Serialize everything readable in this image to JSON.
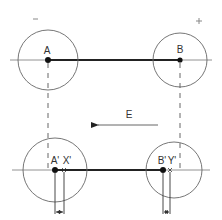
{
  "diagram": {
    "colors": {
      "stroke": "#555555",
      "thick": "#222222",
      "text": "#333333",
      "background": "#ffffff"
    },
    "polarity": {
      "negative": "−",
      "positive": "+"
    },
    "top": {
      "point_a": {
        "label": "A",
        "cx": 48,
        "cy": 60,
        "r": 30
      },
      "point_b": {
        "label": "B",
        "cx": 180,
        "cy": 60,
        "r": 27
      }
    },
    "field": {
      "label": "E",
      "direction": "left"
    },
    "bottom": {
      "point_a_prime": {
        "label": "A'",
        "cx": 55,
        "cy": 170,
        "r": 32
      },
      "point_x_prime": {
        "label": "X'",
        "x": 64
      },
      "point_b_prime": {
        "label": "B'",
        "x": 163
      },
      "point_y_prime": {
        "label": "Y'",
        "x": 170
      },
      "circle_b": {
        "cx": 174,
        "cy": 170,
        "r": 28
      }
    }
  }
}
